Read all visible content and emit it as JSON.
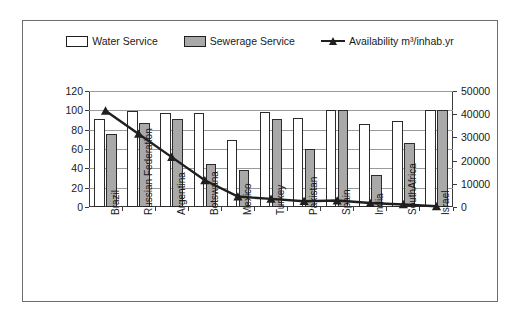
{
  "legend": {
    "items": [
      {
        "name": "water-service",
        "label": "Water Service",
        "swatch": "water",
        "color": "#ffffff"
      },
      {
        "name": "sewerage-service",
        "label": "Sewerage Service",
        "swatch": "sewer",
        "color": "#a9a9a9"
      },
      {
        "name": "availability",
        "label": "Availability m³/inhab.yr",
        "swatch": "line",
        "color": "#1f1f1f"
      }
    ]
  },
  "chart_data": {
    "type": "bar",
    "title": "",
    "xlabel": "",
    "ylabel": "",
    "grid": true,
    "legend_position": "top",
    "categories": [
      "Brazil",
      "Russian Federation",
      "Argentina",
      "Botswana",
      "Mexico",
      "Turkey",
      "Pakistan",
      "Spain",
      "India",
      "SouthAfrica",
      "Israel"
    ],
    "series": [
      {
        "name": "Water Service",
        "type": "bar",
        "axis": "left",
        "values": [
          91,
          99,
          97,
          97,
          69,
          98,
          92,
          100,
          86,
          89,
          100
        ]
      },
      {
        "name": "Sewerage Service",
        "type": "bar",
        "axis": "left",
        "values": [
          76,
          87,
          91,
          45,
          38,
          91,
          60,
          100,
          33,
          66,
          100
        ]
      },
      {
        "name": "Availability m³/inhab.yr",
        "type": "line",
        "axis": "right",
        "values": [
          41500,
          31500,
          21500,
          11500,
          4500,
          3500,
          2500,
          2800,
          1700,
          1100,
          300
        ]
      }
    ],
    "left_axis": {
      "min": 0,
      "max": 120,
      "step": 20,
      "ticks": [
        "0",
        "20",
        "40",
        "60",
        "80",
        "100",
        "120"
      ]
    },
    "right_axis": {
      "min": 0,
      "max": 50000,
      "step": 10000,
      "ticks": [
        "0",
        "10000",
        "20000",
        "30000",
        "40000",
        "50000"
      ]
    }
  }
}
